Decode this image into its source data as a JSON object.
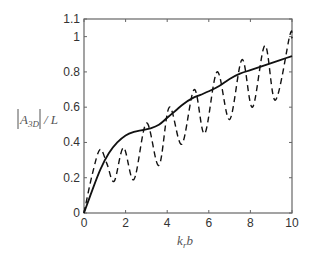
{
  "chart_data": {
    "type": "line",
    "title": "",
    "xlabel": "k_r b",
    "ylabel": "|A_3D| / L",
    "xlim": [
      0,
      10
    ],
    "ylim": [
      0,
      1.1
    ],
    "xticks": [
      0,
      2,
      4,
      6,
      8,
      10
    ],
    "yticks": [
      0,
      0.2,
      0.4,
      0.6,
      0.8,
      1,
      1.1
    ],
    "ytick_labels": [
      "0",
      "0.2",
      "0.4",
      "0.6",
      "0.8",
      "1",
      "1.1"
    ],
    "xtick_labels": [
      "0",
      "2",
      "4",
      "6",
      "8",
      "10"
    ],
    "grid": false,
    "legend": null,
    "series": [
      {
        "name": "solid",
        "style": "solid",
        "x": [
          0,
          0.4,
          0.8,
          1.2,
          1.6,
          2.0,
          2.4,
          2.8,
          3.2,
          3.6,
          4.0,
          4.4,
          4.8,
          5.2,
          5.6,
          6.0,
          6.5,
          7.0,
          7.5,
          8.0,
          8.5,
          9.0,
          9.5,
          10.0
        ],
        "y": [
          0,
          0.13,
          0.25,
          0.34,
          0.4,
          0.44,
          0.46,
          0.47,
          0.48,
          0.5,
          0.54,
          0.58,
          0.62,
          0.65,
          0.67,
          0.69,
          0.72,
          0.76,
          0.79,
          0.81,
          0.83,
          0.85,
          0.87,
          0.89
        ]
      },
      {
        "name": "dashed",
        "style": "dashed",
        "x": [
          0,
          0.4,
          0.77,
          1.1,
          1.45,
          1.9,
          2.4,
          3.0,
          3.6,
          4.1,
          4.7,
          5.3,
          5.8,
          6.4,
          7.0,
          7.6,
          8.1,
          8.7,
          9.2,
          9.9,
          10.0
        ],
        "y": [
          0,
          0.22,
          0.36,
          0.28,
          0.18,
          0.37,
          0.19,
          0.51,
          0.27,
          0.6,
          0.39,
          0.7,
          0.45,
          0.8,
          0.53,
          0.87,
          0.6,
          0.95,
          0.64,
          1.01,
          0.99
        ]
      }
    ]
  },
  "axes": {
    "xlabel_main": "k",
    "xlabel_sub": "r",
    "xlabel_tail": "b",
    "ylabel_main": "A",
    "ylabel_sub": "3D",
    "ylabel_tail": "/ L"
  }
}
